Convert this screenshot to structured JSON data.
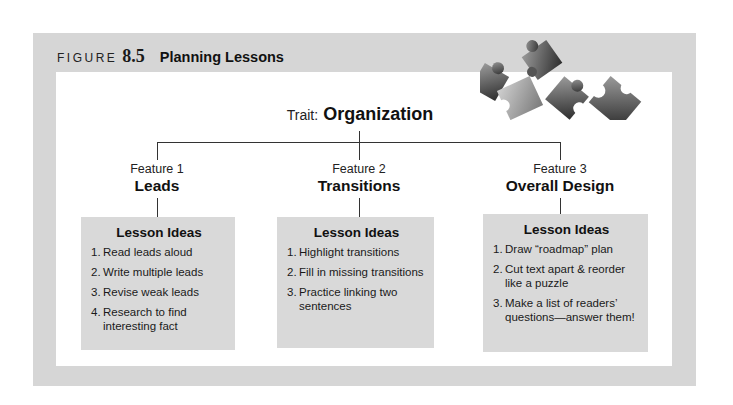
{
  "figure": {
    "label": "FIGURE",
    "number": "8.5",
    "title": "Planning Lessons",
    "decoration": "puzzle-pieces-icon"
  },
  "trait": {
    "label": "Trait:",
    "value": "Organization"
  },
  "features": [
    {
      "number_label": "Feature 1",
      "name": "Leads",
      "box_title": "Lesson Ideas",
      "ideas": [
        {
          "n": "1.",
          "text": "Read leads aloud"
        },
        {
          "n": "2.",
          "text": "Write multiple leads"
        },
        {
          "n": "3.",
          "text": "Revise weak leads"
        },
        {
          "n": "4.",
          "text": "Research to find interesting fact"
        }
      ]
    },
    {
      "number_label": "Feature 2",
      "name": "Transitions",
      "box_title": "Lesson Ideas",
      "ideas": [
        {
          "n": "1.",
          "text": "Highlight transitions"
        },
        {
          "n": "2.",
          "text": "Fill in missing transitions"
        },
        {
          "n": "3.",
          "text": "Practice linking two sentences"
        }
      ]
    },
    {
      "number_label": "Feature 3",
      "name": "Overall Design",
      "box_title": "Lesson Ideas",
      "ideas": [
        {
          "n": "1.",
          "text": "Draw “roadmap” plan"
        },
        {
          "n": "2.",
          "text": "Cut text apart & reorder like a puzzle"
        },
        {
          "n": "3.",
          "text": "Make a list of readers’ questions—answer them!"
        }
      ]
    }
  ],
  "colors": {
    "frame": "#d6d6d6",
    "box": "#d9d9d9",
    "lines": "#333333",
    "text": "#111111"
  }
}
